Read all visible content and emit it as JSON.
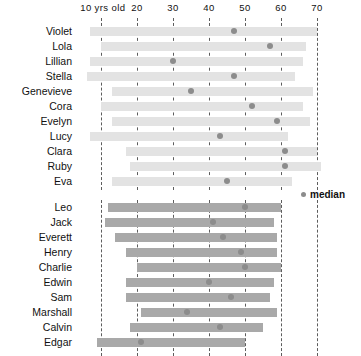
{
  "chart_data": {
    "type": "bar",
    "title": "",
    "xlabel": "10 yrs old",
    "ylabel": "",
    "xlim": [
      7,
      75
    ],
    "grid": true,
    "legend": {
      "position": "right",
      "label": "median",
      "marker": "dot"
    },
    "axis": {
      "ticks": [
        10,
        20,
        30,
        40,
        50,
        60,
        70
      ],
      "tick_labels": [
        "10 yrs old",
        "20",
        "30",
        "40",
        "50",
        "60",
        "70"
      ]
    },
    "colors": {
      "bar_group_1": "#e3e3e3",
      "bar_group_2": "#a9a9a9",
      "median_dot": "#8c8c8c",
      "gridline": "#555555",
      "text": "#111111",
      "background": "#ffffff"
    },
    "groups": [
      {
        "name": "group-1",
        "bar_color": "#e3e3e3",
        "rows": [
          {
            "label": "Violet",
            "start": 7,
            "end": 70,
            "median": 47
          },
          {
            "label": "Lola",
            "start": 10,
            "end": 67,
            "median": 57
          },
          {
            "label": "Lillian",
            "start": 7,
            "end": 66,
            "median": 30
          },
          {
            "label": "Stella",
            "start": 6,
            "end": 64,
            "median": 47
          },
          {
            "label": "Genevieve",
            "start": 13,
            "end": 69,
            "median": 35
          },
          {
            "label": "Cora",
            "start": 10,
            "end": 66,
            "median": 52
          },
          {
            "label": "Evelyn",
            "start": 13,
            "end": 68,
            "median": 59
          },
          {
            "label": "Lucy",
            "start": 7,
            "end": 62,
            "median": 43
          },
          {
            "label": "Clara",
            "start": 17,
            "end": 70,
            "median": 61
          },
          {
            "label": "Ruby",
            "start": 18,
            "end": 71,
            "median": 61
          },
          {
            "label": "Eva",
            "start": 13,
            "end": 63,
            "median": 45
          }
        ]
      },
      {
        "name": "group-2",
        "bar_color": "#a9a9a9",
        "rows": [
          {
            "label": "Leo",
            "start": 12,
            "end": 60,
            "median": 50
          },
          {
            "label": "Jack",
            "start": 11,
            "end": 58,
            "median": 41
          },
          {
            "label": "Everett",
            "start": 14,
            "end": 59,
            "median": 44
          },
          {
            "label": "Henry",
            "start": 17,
            "end": 59,
            "median": 49
          },
          {
            "label": "Charlie",
            "start": 20,
            "end": 60,
            "median": 50
          },
          {
            "label": "Edwin",
            "start": 17,
            "end": 58,
            "median": 40
          },
          {
            "label": "Sam",
            "start": 17,
            "end": 57,
            "median": 46
          },
          {
            "label": "Marshall",
            "start": 21,
            "end": 59,
            "median": 34
          },
          {
            "label": "Calvin",
            "start": 18,
            "end": 55,
            "median": 43
          },
          {
            "label": "Edgar",
            "start": 9,
            "end": 50,
            "median": 21
          }
        ]
      }
    ]
  }
}
